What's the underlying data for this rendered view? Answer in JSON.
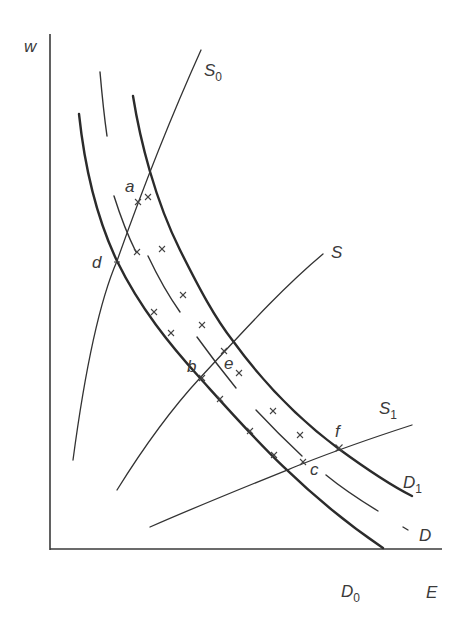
{
  "diagram": {
    "type": "labor market supply-demand diagram",
    "axes": {
      "y_label": "w",
      "x_label": "E"
    },
    "curves": {
      "S0": {
        "label": "S",
        "subscript": "0",
        "style": "thin"
      },
      "S": {
        "label": "S",
        "subscript": "",
        "style": "thin"
      },
      "S1": {
        "label": "S",
        "subscript": "1",
        "style": "thin"
      },
      "D0": {
        "label": "D",
        "subscript": "0",
        "style": "thick"
      },
      "D1": {
        "label": "D",
        "subscript": "1",
        "style": "thick"
      },
      "D": {
        "label": "D",
        "subscript": "",
        "style": "dashed"
      }
    },
    "points": {
      "a": "a",
      "b": "b",
      "c": "c",
      "d": "d",
      "e": "e",
      "f": "f"
    },
    "markers": {
      "symbol": "×",
      "count": 20
    },
    "colors": {
      "line": "#2b2b2b",
      "text": "#3a3a3a",
      "background": "#ffffff"
    }
  }
}
